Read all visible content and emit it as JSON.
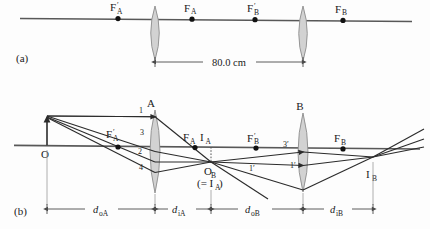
{
  "figure": {
    "panels": [
      {
        "key": "a",
        "label": "(a)"
      },
      {
        "key": "b",
        "label": "(b)"
      }
    ]
  },
  "panel_a": {
    "label": "(a)",
    "focal_points": [
      {
        "name": "F-prime-A",
        "base": "F",
        "prime": "′",
        "sub": "A",
        "x": 118
      },
      {
        "name": "F-A",
        "base": "F",
        "prime": "",
        "sub": "A",
        "x": 192
      },
      {
        "name": "F-prime-B",
        "base": "F",
        "prime": "′",
        "sub": "B",
        "x": 255
      },
      {
        "name": "F-B",
        "base": "F",
        "prime": "",
        "sub": "B",
        "x": 343
      }
    ],
    "lenses": [
      {
        "name": "lens-A",
        "x": 155
      },
      {
        "name": "lens-B",
        "x": 303
      }
    ],
    "separation": {
      "label": "80.0 cm",
      "value": "80.0",
      "unit": "cm",
      "from_x": 155,
      "to_x": 303
    }
  },
  "panel_b": {
    "label": "(b)",
    "object": {
      "name": "O",
      "label": "O",
      "x": 47
    },
    "lenses": [
      {
        "name": "lens-A",
        "label": "A",
        "x": 155
      },
      {
        "name": "lens-B",
        "label": "B",
        "x": 303
      }
    ],
    "focal_points": [
      {
        "name": "F-prime-A",
        "base": "F",
        "prime": "′",
        "sub": "A",
        "x": 118,
        "label_x": 112,
        "label_y": 138
      },
      {
        "name": "F-A",
        "base": "F",
        "prime": "",
        "sub": "A",
        "x": 195,
        "label_x": 186,
        "label_y": 142
      },
      {
        "name": "F-prime-B",
        "base": "F",
        "prime": "′",
        "sub": "B",
        "x": 256,
        "label_x": 250,
        "label_y": 142
      },
      {
        "name": "F-B",
        "base": "F",
        "prime": "",
        "sub": "B",
        "x": 343,
        "label_x": 335,
        "label_y": 142
      }
    ],
    "images": [
      {
        "name": "I-A",
        "base": "I",
        "sub": "A",
        "label_x": 205,
        "label_y": 142
      },
      {
        "name": "I-B",
        "base": "I",
        "sub": "B",
        "label_x": 368,
        "label_y": 178
      }
    ],
    "object_b": {
      "name": "O-B",
      "base": "O",
      "sub": "B",
      "note": "(= I",
      "note_sub": "A",
      "note_end": ")",
      "x": 211,
      "y": 162
    },
    "ray_labels": [
      {
        "name": "ray-label-1",
        "text": "1",
        "x": 139,
        "y": 113
      },
      {
        "name": "ray-label-3",
        "text": "3",
        "x": 140,
        "y": 135
      },
      {
        "name": "ray-label-2",
        "text": "2",
        "x": 138,
        "y": 152
      },
      {
        "name": "ray-label-4",
        "text": "4",
        "x": 139,
        "y": 168
      },
      {
        "name": "ray-label-3p",
        "text": "3′",
        "x": 283,
        "y": 147
      },
      {
        "name": "ray-label-1p",
        "text": "1′",
        "x": 289,
        "y": 167
      },
      {
        "name": "ray-label-1p-left",
        "text": "1′",
        "x": 249,
        "y": 170
      }
    ],
    "distances": [
      {
        "name": "d-oA",
        "base": "d",
        "sub": "oA",
        "from_x": 47,
        "to_x": 155
      },
      {
        "name": "d-iA",
        "base": "d",
        "sub": "iA",
        "from_x": 155,
        "to_x": 211
      },
      {
        "name": "d-oB",
        "base": "d",
        "sub": "oB",
        "from_x": 211,
        "to_x": 303
      },
      {
        "name": "d-iB",
        "base": "d",
        "sub": "iB",
        "from_x": 303,
        "to_x": 373
      }
    ]
  },
  "colors": {
    "axis": "#585858",
    "ray": "#2b2b2b",
    "lens_fill": "#d2d2d2",
    "lens_stroke": "#8c8c8c",
    "text": "#1a1a1a",
    "background": "#fdfdfd"
  }
}
